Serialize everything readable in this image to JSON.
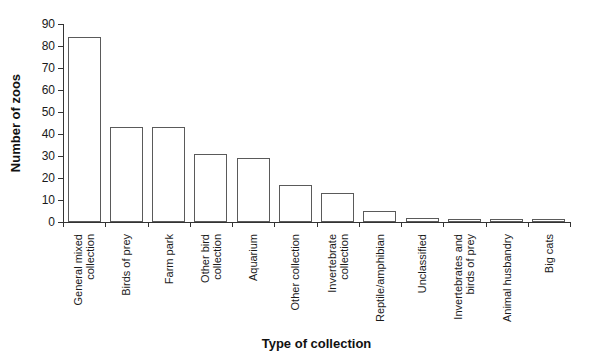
{
  "figure": {
    "background": "#ffffff"
  },
  "chart_data": {
    "type": "bar",
    "ylabel": "Number of zoos",
    "xlabel": "Type of collection",
    "ylim": [
      0,
      90
    ],
    "yticks": [
      0,
      10,
      20,
      30,
      40,
      50,
      60,
      70,
      80,
      90
    ],
    "categories": [
      "General mixed\ncollection",
      "Birds of prey",
      "Farm park",
      "Other bird\ncollection",
      "Aquarium",
      "Other collection",
      "Invertebrate\ncollection",
      "Reptile/amphibian",
      "Unclassified",
      "Invertebrates and\nbirds of prey",
      "Animal husbandry",
      "Big cats"
    ],
    "values": [
      84,
      43,
      43,
      31,
      29,
      17,
      13,
      5,
      2,
      1,
      1,
      1
    ],
    "bar_fill": "#ffffff",
    "bar_border": "#5a5a5a",
    "axis_color": "#333333",
    "grid": false,
    "legend": null
  }
}
